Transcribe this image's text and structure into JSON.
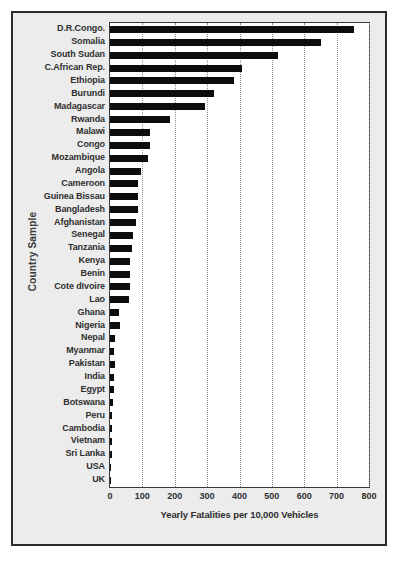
{
  "figure": {
    "background_color": "#ececed",
    "frame_color": "#2b2b2b",
    "plot_background": "#ffffff",
    "bar_color": "#0d0d0d",
    "grid_color": "#8d8d8d"
  },
  "chart_data": {
    "type": "bar",
    "orientation": "horizontal",
    "title": "",
    "xlabel": "Yearly Fatalities per 10,000 Vehicles",
    "ylabel": "Country Sample",
    "xlim": [
      0,
      800
    ],
    "xticks": [
      0,
      100,
      200,
      300,
      400,
      500,
      600,
      700,
      800
    ],
    "grid": true,
    "legend": "none",
    "categories": [
      "D.R.Congo.",
      "Somalia",
      "South Sudan",
      "C.African Rep.",
      "Ethiopia",
      "Burundi",
      "Madagascar",
      "Rwanda",
      "Malawi",
      "Congo",
      "Mozambique",
      "Angola",
      "Cameroon",
      "Guinea Bissau",
      "Bangladesh",
      "Afghanistan",
      "Senegal",
      "Tanzania",
      "Kenya",
      "Benin",
      "Cote dIvoire",
      "Lao",
      "Ghana",
      "Nigeria",
      "Nepal",
      "Myanmar",
      "Pakistan",
      "India",
      "Egypt",
      "Botswana",
      "Peru",
      "Cambodia",
      "Vietnam",
      "Sri Lanka",
      "USA",
      "UK"
    ],
    "values": [
      754,
      653,
      520,
      408,
      382,
      321,
      293,
      186,
      124,
      123,
      116,
      96,
      87,
      88,
      86,
      81,
      70,
      69,
      62,
      63,
      62,
      59,
      29,
      31,
      16,
      11,
      14,
      12,
      12,
      8,
      7,
      7,
      6,
      6,
      2,
      1
    ]
  }
}
